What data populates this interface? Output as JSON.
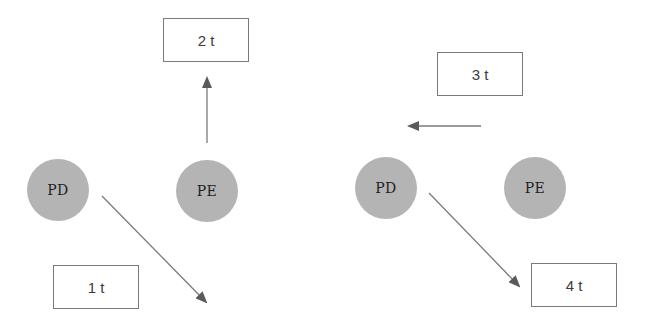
{
  "diagram": {
    "panels": [
      {
        "id": "left",
        "nodes": [
          {
            "label": "PD"
          },
          {
            "label": "PE"
          }
        ],
        "labels": [
          {
            "text": "2 t"
          },
          {
            "text": "1 t"
          }
        ]
      },
      {
        "id": "right",
        "nodes": [
          {
            "label": "PD"
          },
          {
            "label": "PE"
          }
        ],
        "labels": [
          {
            "text": "3 t"
          },
          {
            "text": "4 t"
          }
        ]
      }
    ],
    "arrows": [
      {
        "from": "left PE",
        "direction": "up",
        "toward": "2 t"
      },
      {
        "from": "left PD",
        "direction": "down-right",
        "toward": "1 t"
      },
      {
        "from": "right (between 3 t and PD)",
        "direction": "left",
        "toward": "3 t"
      },
      {
        "from": "right PD",
        "direction": "down-right",
        "toward": "4 t"
      }
    ],
    "colors": {
      "node_fill": "#b4b4b4",
      "node_text": "#1e1e1e",
      "box_border": "#7a7a7a",
      "box_text": "#3c3c3c",
      "arrow_line": "#7a7a7a",
      "arrow_head": "#5a5a5a"
    }
  }
}
